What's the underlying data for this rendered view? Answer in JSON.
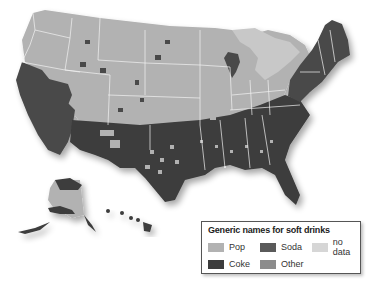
{
  "map": {
    "title": "Generic names for soft drinks",
    "region": "United States (by county)",
    "colors": {
      "pop": "#b2b2b2",
      "soda": "#5a5a5a",
      "coke": "#3c3c3c",
      "other": "#8c8c8c",
      "no_data": "#d6d6d6",
      "lakes": "#c8c8c8",
      "border": "#f2f2f2"
    }
  },
  "legend": {
    "title": "Generic names for soft drinks",
    "items": [
      {
        "label": "Pop",
        "color": "#b2b2b2"
      },
      {
        "label": "Soda",
        "color": "#5a5a5a"
      },
      {
        "label": "no data",
        "color": "#d6d6d6"
      },
      {
        "label": "Coke",
        "color": "#3c3c3c"
      },
      {
        "label": "Other",
        "color": "#8c8c8c"
      }
    ]
  }
}
